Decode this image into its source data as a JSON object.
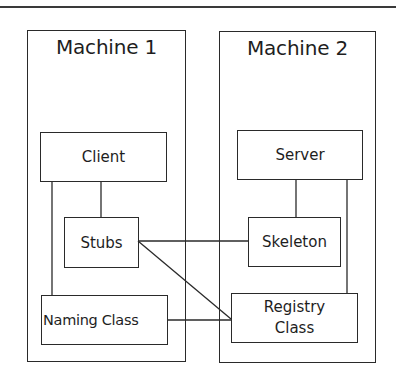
{
  "diagram": {
    "machines": [
      {
        "id": "machine1",
        "title": "Machine 1"
      },
      {
        "id": "machine2",
        "title": "Machine 2"
      }
    ],
    "nodes": {
      "client": "Client",
      "stubs": "Stubs",
      "naming_class": "Naming Class",
      "server": "Server",
      "skeleton": "Skeleton",
      "registry_class_line1": "Registry",
      "registry_class_line2": "Class"
    },
    "edges": [
      {
        "from": "Client",
        "to": "Stubs"
      },
      {
        "from": "Client",
        "to": "Naming Class"
      },
      {
        "from": "Server",
        "to": "Skeleton"
      },
      {
        "from": "Server",
        "to": "Registry Class"
      },
      {
        "from": "Stubs",
        "to": "Skeleton"
      },
      {
        "from": "Stubs",
        "to": "Registry Class"
      },
      {
        "from": "Naming Class",
        "to": "Registry Class"
      }
    ],
    "colors": {
      "stroke": "#2a2a2a",
      "text": "#1e1e1e",
      "background": "#ffffff"
    }
  }
}
